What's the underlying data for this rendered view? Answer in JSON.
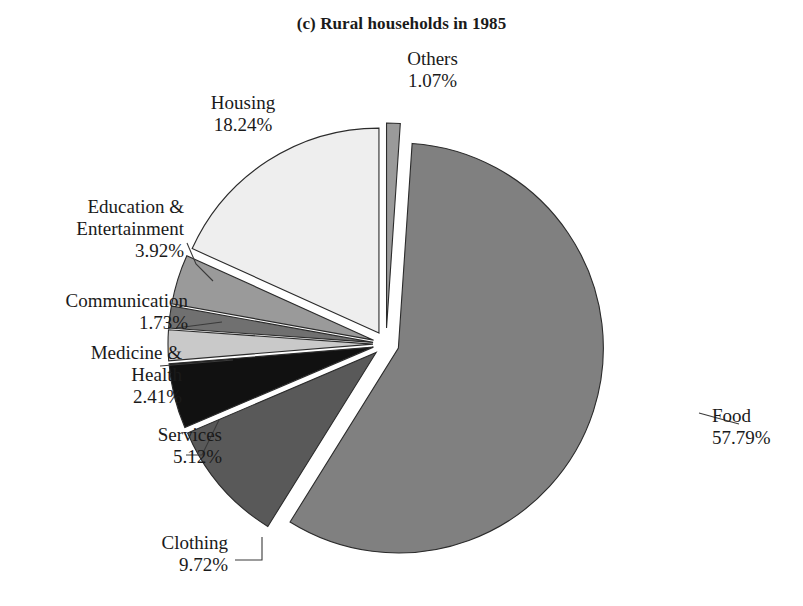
{
  "chart_data": {
    "type": "pie",
    "title": "(c) Rural households in 1985",
    "xlabel": "",
    "ylabel": "",
    "legend_position": "none",
    "grid": false,
    "exploded": true,
    "value_suffix": "%",
    "start_angle_deg": -90,
    "direction": "clockwise",
    "categories": [
      "Others",
      "Food",
      "Clothing",
      "Services",
      "Medicine & Health",
      "Communication",
      "Education & Entertainment",
      "Housing"
    ],
    "values": [
      1.07,
      57.79,
      9.72,
      5.12,
      2.41,
      1.73,
      3.92,
      18.24
    ],
    "slices": [
      {
        "name": "Others",
        "value": 1.07,
        "value_text": "1.07%",
        "color": "#9a9a9a",
        "label_lines": [
          "Others",
          "1.07%"
        ],
        "label_align": "center",
        "label_x": 380,
        "label_y": 48,
        "label_width": 105,
        "leader": ""
      },
      {
        "name": "Food",
        "value": 57.79,
        "value_text": "57.79%",
        "color": "#808080",
        "label_lines": [
          "Food",
          "57.79%"
        ],
        "label_align": "left",
        "label_x": 712,
        "label_y": 405,
        "label_width": 92,
        "leader": "M 699 413 L 739 424"
      },
      {
        "name": "Clothing",
        "value": 9.72,
        "value_text": "9.72%",
        "color": "#595959",
        "label_lines": [
          "Clothing",
          "9.72%"
        ],
        "label_align": "right",
        "label_x": 118,
        "label_y": 532,
        "label_width": 110,
        "leader": "M 235 560 L 262 560 L 262 537"
      },
      {
        "name": "Services",
        "value": 5.12,
        "value_text": "5.12%",
        "color": "#111111",
        "label_lines": [
          "Services",
          "5.12%"
        ],
        "label_align": "right",
        "label_x": 110,
        "label_y": 424,
        "label_width": 112,
        "leader": "M 186 455 L 202 455 L 219 420"
      },
      {
        "name": "Medicine & Health",
        "value": 2.41,
        "value_text": "2.41%",
        "color": "#c9c9c9",
        "label_lines": [
          "Medicine &",
          "Health",
          "2.41%"
        ],
        "label_align": "right",
        "label_x": 54,
        "label_y": 342,
        "label_width": 128,
        "leader": "M 160 366 L 233 360"
      },
      {
        "name": "Communication",
        "value": 1.73,
        "value_text": "1.73%",
        "color": "#707070",
        "label_lines": [
          "Communication",
          "1.73%"
        ],
        "label_align": "right",
        "label_x": 24,
        "label_y": 290,
        "label_width": 164,
        "leader": "M 176 328 L 222 322"
      },
      {
        "name": "Education & Entertainment",
        "value": 3.92,
        "value_text": "3.92%",
        "color": "#9a9a9a",
        "label_lines": [
          "Education &",
          "Entertainment",
          "3.92%"
        ],
        "label_align": "right",
        "label_x": 48,
        "label_y": 196,
        "label_width": 136,
        "leader": "M 187 243 L 196 264 L 213 281"
      },
      {
        "name": "Housing",
        "value": 18.24,
        "value_text": "18.24%",
        "color": "#eeeeee",
        "label_lines": [
          "Housing",
          "18.24%"
        ],
        "label_align": "center",
        "label_x": 178,
        "label_y": 92,
        "label_width": 130,
        "leader": ""
      }
    ],
    "geometry": {
      "center_x": 386,
      "center_y": 344,
      "radius": 205,
      "explode_offset": 13,
      "explode_offset_small": 16
    }
  }
}
